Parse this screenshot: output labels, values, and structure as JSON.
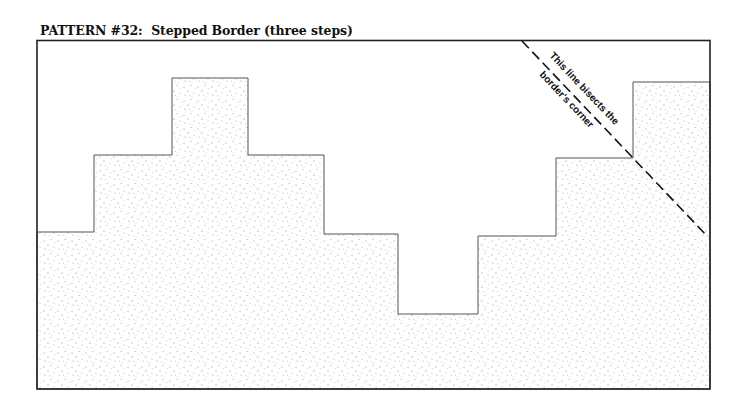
{
  "title": "PATTERN #32:  Stepped Border (three steps)",
  "annotation": {
    "line1": "This line bisects the",
    "line2": "border's corner"
  },
  "colors": {
    "frame": "#222222",
    "step_outline": "#555555",
    "stipple": "#777777",
    "dashed_line": "#111111"
  }
}
